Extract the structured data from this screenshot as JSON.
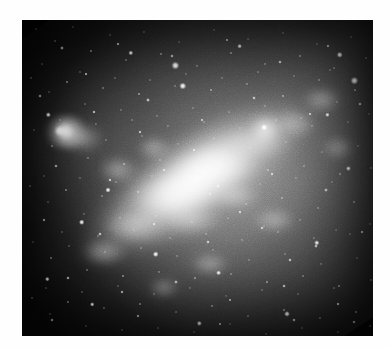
{
  "page": {
    "width": 390,
    "height": 348,
    "background_color": "#ffffff",
    "margin_color": "#ffffff"
  },
  "image": {
    "kind": "astronomical-photograph",
    "subject_description": "Grayscale telescopic image of an irregular barred galaxy with a bright elongated bar running from lower-left to upper-right",
    "color_mode": "grayscale",
    "frame": {
      "x": 22,
      "y": 20,
      "width": 351,
      "height": 316
    },
    "background_sky_color": "#0b0b0b",
    "brightest_color": "#ffffff",
    "midtone_color": "#8a8a8a",
    "darkest_corner": "top-left",
    "brightest_corner": "center",
    "bar_position_angle_degrees": -33,
    "features": [
      {
        "name": "galaxy-bar",
        "cx": 0.5,
        "cy": 0.5,
        "brightness": "very-high"
      },
      {
        "name": "galaxy-core",
        "cx": 0.48,
        "cy": 0.5,
        "brightness": "peak"
      },
      {
        "name": "hii-region-knot-left",
        "cx": 0.11,
        "cy": 0.36,
        "brightness": "high"
      },
      {
        "name": "star-knot-bar-upper-right",
        "cx": 0.69,
        "cy": 0.35,
        "brightness": "high"
      },
      {
        "name": "diffuse-halo",
        "cx": 0.55,
        "cy": 0.52,
        "brightness": "medium"
      },
      {
        "name": "dark-sky-lower-right",
        "cx": 0.82,
        "cy": 0.85,
        "brightness": "low"
      },
      {
        "name": "dark-sky-upper-left",
        "cx": 0.12,
        "cy": 0.1,
        "brightness": "low"
      }
    ],
    "bright_foreground_stars": [
      {
        "cx": 0.437,
        "cy": 0.144,
        "r": 3.1
      },
      {
        "cx": 0.458,
        "cy": 0.209,
        "r": 2.7
      },
      {
        "cx": 0.947,
        "cy": 0.192,
        "r": 3.0
      },
      {
        "cx": 0.905,
        "cy": 0.11,
        "r": 2.3
      },
      {
        "cx": 0.107,
        "cy": 0.351,
        "r": 4.2
      },
      {
        "cx": 0.075,
        "cy": 0.3,
        "r": 2.0
      },
      {
        "cx": 0.69,
        "cy": 0.34,
        "r": 2.6
      },
      {
        "cx": 0.31,
        "cy": 0.104,
        "r": 1.9
      },
      {
        "cx": 0.62,
        "cy": 0.083,
        "r": 1.8
      },
      {
        "cx": 0.245,
        "cy": 0.538,
        "r": 2.0
      },
      {
        "cx": 0.17,
        "cy": 0.64,
        "r": 2.1
      },
      {
        "cx": 0.381,
        "cy": 0.741,
        "r": 2.2
      },
      {
        "cx": 0.56,
        "cy": 0.8,
        "r": 1.9
      },
      {
        "cx": 0.84,
        "cy": 0.705,
        "r": 2.0
      },
      {
        "cx": 0.755,
        "cy": 0.93,
        "r": 2.2
      },
      {
        "cx": 0.072,
        "cy": 0.82,
        "r": 1.8
      },
      {
        "cx": 0.93,
        "cy": 0.47,
        "r": 1.9
      },
      {
        "cx": 0.505,
        "cy": 0.96,
        "r": 2.0
      },
      {
        "cx": 0.2,
        "cy": 0.9,
        "r": 1.7
      },
      {
        "cx": 0.87,
        "cy": 0.3,
        "r": 1.7
      }
    ]
  },
  "chart_data": {
    "type": "heatmap",
    "title": "",
    "xlabel": "",
    "ylabel": "",
    "grid": false,
    "legend": "none",
    "colormap": "grayscale",
    "vmin": 0,
    "vmax": 255,
    "x": [
      0.0,
      0.125,
      0.25,
      0.375,
      0.5,
      0.625,
      0.75,
      0.875,
      1.0
    ],
    "y": [
      0.0,
      0.125,
      0.25,
      0.375,
      0.5,
      0.625,
      0.75,
      0.875,
      1.0
    ],
    "values": [
      [
        8,
        10,
        14,
        20,
        30,
        44,
        60,
        72,
        66
      ],
      [
        10,
        14,
        20,
        30,
        46,
        66,
        92,
        108,
        96
      ],
      [
        16,
        26,
        44,
        56,
        74,
        104,
        140,
        150,
        120
      ],
      [
        40,
        86,
        96,
        86,
        110,
        150,
        196,
        178,
        130
      ],
      [
        30,
        66,
        104,
        140,
        186,
        228,
        220,
        166,
        116
      ],
      [
        22,
        48,
        96,
        160,
        226,
        212,
        168,
        120,
        80
      ],
      [
        14,
        30,
        60,
        110,
        150,
        134,
        96,
        66,
        44
      ],
      [
        10,
        18,
        34,
        60,
        84,
        72,
        50,
        34,
        24
      ],
      [
        8,
        12,
        20,
        34,
        46,
        40,
        28,
        20,
        14
      ]
    ]
  }
}
